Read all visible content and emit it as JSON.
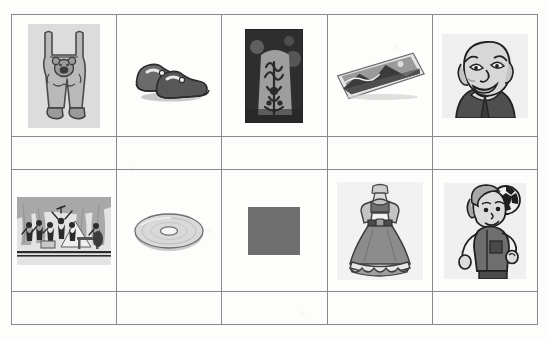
{
  "worksheet": {
    "kind": "picture-grid-worksheet",
    "columns": 5,
    "rows": 4,
    "border_color": "#8a8a8a",
    "background_color": "#fdfdfc",
    "rows_data": [
      {
        "type": "picture-row",
        "cells": [
          {
            "name": "overalls",
            "label": "grey dungarees with bear motif",
            "tone": "#b9b9b9"
          },
          {
            "name": "shoes",
            "label": "pair of dark shoes",
            "tone": "#6b6b6b"
          },
          {
            "name": "ornament-photo",
            "label": "dark photo of ornate carved object",
            "tone": "#3a3a3a"
          },
          {
            "name": "postcard",
            "label": "tilted photograph / postcard",
            "tone": "#8f8f8f"
          },
          {
            "name": "old-man",
            "label": "cartoon of bald elderly man",
            "tone": "#5a5a5a"
          }
        ]
      },
      {
        "type": "answer-row",
        "cells": [
          "",
          "",
          "",
          "",
          ""
        ]
      },
      {
        "type": "picture-row",
        "cells": [
          {
            "name": "orchestra",
            "label": "orchestra on stage with curtains",
            "tone": "#909090"
          },
          {
            "name": "compact-disc",
            "label": "compact disc seen in perspective",
            "tone": "#cfcfcf"
          },
          {
            "name": "grey-square",
            "label": "solid grey square",
            "tone": "#6e6e6e"
          },
          {
            "name": "dress",
            "label": "long grey dress on mannequin",
            "tone": "#8c8c8c"
          },
          {
            "name": "boy-with-ball",
            "label": "boy heading a football",
            "tone": "#7a7a7a"
          }
        ]
      },
      {
        "type": "answer-row",
        "cells": [
          "",
          "",
          "",
          "",
          ""
        ]
      }
    ]
  }
}
